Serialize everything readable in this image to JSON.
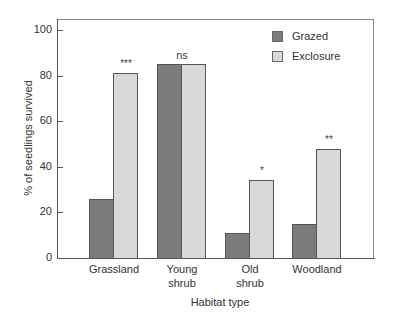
{
  "chart_data": {
    "type": "bar",
    "title": "",
    "xlabel": "Habitat type",
    "ylabel": "% of seedlings survived",
    "ylim": [
      0,
      100
    ],
    "yticks": [
      "0",
      "20",
      "40",
      "60",
      "80",
      "100"
    ],
    "categories": [
      "Grassland",
      "Young\nshrub",
      "Old\nshrub",
      "Woodland"
    ],
    "series": [
      {
        "name": "Grazed",
        "color": "#7c7c7c",
        "values": [
          26,
          85,
          11,
          15
        ]
      },
      {
        "name": "Exclosure",
        "color": "#d9d9d9",
        "values": [
          81,
          85,
          34,
          48
        ]
      }
    ],
    "significance": [
      "***",
      "ns",
      "*",
      "**"
    ],
    "legend_position": "upper right",
    "grid": false
  },
  "legend": {
    "grazed": "Grazed",
    "exclosure": "Exclosure"
  },
  "axes": {
    "x_title": "Habitat type",
    "y_title": "% of seedlings survived"
  }
}
